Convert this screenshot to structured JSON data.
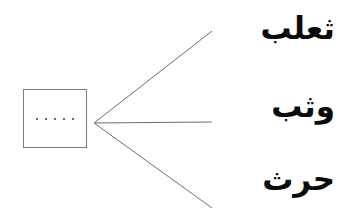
{
  "worksheet": {
    "language": "arabic",
    "ink_color": "#0a0a0a",
    "box_border_color": "#7b7b7b",
    "line_color": "#6f6f6f",
    "background_color": "#ffffff",
    "blank_box": {
      "placeholder_text": ".....",
      "dot_count": 5,
      "dots": [
        ".",
        ".",
        ".",
        ".",
        "."
      ]
    },
    "connectors": [
      {
        "name": "connector-line-top",
        "from": "blank-box",
        "to": "word-0"
      },
      {
        "name": "connector-line-middle",
        "from": "blank-box",
        "to": "word-1"
      },
      {
        "name": "connector-line-bottom",
        "from": "blank-box",
        "to": "word-2"
      }
    ],
    "words": [
      {
        "text": "ثعلب"
      },
      {
        "text": "وثب"
      },
      {
        "text": "حرث"
      }
    ]
  }
}
